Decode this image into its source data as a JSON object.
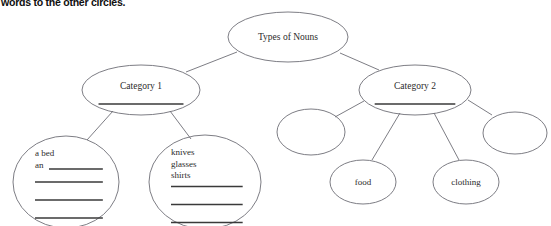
{
  "page": {
    "width": 551,
    "height": 226,
    "background": "#ffffff",
    "instruction_text": "words to the other circles.",
    "ellipse_stroke": "#6e6e76",
    "blank_line_color": "#3a3a3a",
    "connector_color": "#6e6e76",
    "text_color": "#2b2b2b"
  },
  "diagram": {
    "type": "tree",
    "nodes": [
      {
        "id": "root",
        "label": "Types of Nouns",
        "cx": 288,
        "cy": 37,
        "rx": 60,
        "ry": 25,
        "has_blank_line": false,
        "items": []
      },
      {
        "id": "category1",
        "label": "Category 1",
        "cx": 141,
        "cy": 90,
        "rx": 59,
        "ry": 25,
        "has_blank_line": true,
        "items": []
      },
      {
        "id": "category2",
        "label": "Category 2",
        "cx": 415,
        "cy": 90,
        "rx": 56,
        "ry": 25,
        "has_blank_line": true,
        "items": []
      },
      {
        "id": "cat1-child-1",
        "label": "",
        "cx": 66,
        "cy": 182,
        "rx": 53,
        "ry": 46,
        "has_blank_line": false,
        "items": [
          "a bed",
          "an"
        ],
        "blank_lines": 4
      },
      {
        "id": "cat1-child-2",
        "label": "",
        "cx": 205,
        "cy": 182,
        "rx": 56,
        "ry": 47,
        "has_blank_line": false,
        "items": [
          "knives",
          "glasses",
          "shirts"
        ],
        "blank_lines": 3
      },
      {
        "id": "cat2-child-1",
        "label": "",
        "cx": 311,
        "cy": 132,
        "rx": 34,
        "ry": 23,
        "has_blank_line": false,
        "items": []
      },
      {
        "id": "cat2-child-2",
        "label": "food",
        "cx": 363,
        "cy": 182,
        "rx": 33,
        "ry": 22,
        "has_blank_line": false,
        "items": []
      },
      {
        "id": "cat2-child-3",
        "label": "clothing",
        "cx": 466,
        "cy": 182,
        "rx": 33,
        "ry": 22,
        "has_blank_line": false,
        "items": []
      },
      {
        "id": "cat2-child-4",
        "label": "",
        "cx": 515,
        "cy": 133,
        "rx": 32,
        "ry": 21,
        "has_blank_line": false,
        "items": []
      }
    ],
    "edges": [
      {
        "from": "root",
        "to": "category1",
        "x1": 237,
        "y1": 52,
        "x2": 186,
        "y2": 72
      },
      {
        "from": "root",
        "to": "category2",
        "x1": 340,
        "y1": 53,
        "x2": 379,
        "y2": 70
      },
      {
        "from": "category1",
        "to": "cat1-child-1",
        "x1": 113,
        "y1": 111,
        "x2": 87,
        "y2": 140
      },
      {
        "from": "category1",
        "to": "cat1-child-2",
        "x1": 170,
        "y1": 111,
        "x2": 191,
        "y2": 139
      },
      {
        "from": "category2",
        "to": "cat2-child-1",
        "x1": 364,
        "y1": 101,
        "x2": 335,
        "y2": 117
      },
      {
        "from": "category2",
        "to": "cat2-child-2",
        "x1": 400,
        "y1": 113,
        "x2": 372,
        "y2": 160
      },
      {
        "from": "category2",
        "to": "cat2-child-3",
        "x1": 434,
        "y1": 113,
        "x2": 459,
        "y2": 160
      },
      {
        "from": "category2",
        "to": "cat2-child-4",
        "x1": 468,
        "y1": 100,
        "x2": 492,
        "y2": 115
      }
    ]
  }
}
